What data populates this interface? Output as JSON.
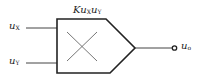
{
  "diagram": {
    "gain_label": {
      "prefix": "K",
      "var1": "u",
      "sub1": "X",
      "var2": "u",
      "sub2": "Y"
    },
    "inputs": [
      {
        "var": "u",
        "sub": "X"
      },
      {
        "var": "u",
        "sub": "Y"
      }
    ],
    "output": {
      "var": "u",
      "sub": "o"
    },
    "colors": {
      "stroke": "#222222",
      "thin_stroke": "#555555",
      "background": "#ffffff"
    }
  }
}
